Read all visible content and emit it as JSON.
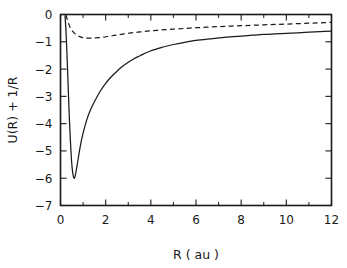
{
  "chart_data": {
    "type": "line",
    "title": "",
    "subtitle": "",
    "xlabel": "R ( au )",
    "ylabel": "U(R) + 1/R",
    "xlim": [
      0,
      12
    ],
    "ylim": [
      -7,
      0
    ],
    "grid": false,
    "legend": null,
    "legend_position": "none",
    "x_ticks": [
      0,
      2,
      4,
      6,
      8,
      10,
      12
    ],
    "x_tick_labels": [
      "0",
      "2",
      "4",
      "6",
      "8",
      "10",
      "12"
    ],
    "x_minor_ticks": [
      1,
      3,
      5,
      7,
      9,
      11
    ],
    "y_ticks": [
      0,
      -1,
      -2,
      -3,
      -4,
      -5,
      -6,
      -7
    ],
    "y_tick_labels": [
      "0",
      "−1",
      "−2",
      "−3",
      "−4",
      "−5",
      "−6",
      "−7"
    ],
    "series": [
      {
        "name": "solid-curve",
        "style": "solid",
        "color": "#1a1a1a",
        "x": [
          0.2,
          0.24,
          0.28,
          0.32,
          0.36,
          0.4,
          0.44,
          0.48,
          0.52,
          0.56,
          0.6,
          0.64,
          0.68,
          0.74,
          0.8,
          0.9,
          1.0,
          1.15,
          1.3,
          1.5,
          1.75,
          2.0,
          2.25,
          2.5,
          2.75,
          3.0,
          3.25,
          3.5,
          4.0,
          4.5,
          5.0,
          5.5,
          6.0,
          6.5,
          7.0,
          7.5,
          8.0,
          8.5,
          9.0,
          9.5,
          10.0,
          10.5,
          11.0,
          11.5,
          12.0
        ],
        "y": [
          -0.05,
          -0.55,
          -1.3,
          -2.2,
          -3.1,
          -3.95,
          -4.65,
          -5.25,
          -5.65,
          -5.9,
          -6.0,
          -5.95,
          -5.8,
          -5.5,
          -5.2,
          -4.72,
          -4.35,
          -3.9,
          -3.55,
          -3.2,
          -2.82,
          -2.52,
          -2.28,
          -2.08,
          -1.9,
          -1.75,
          -1.62,
          -1.52,
          -1.33,
          -1.2,
          -1.1,
          -1.02,
          -0.95,
          -0.9,
          -0.86,
          -0.82,
          -0.79,
          -0.76,
          -0.73,
          -0.71,
          -0.69,
          -0.67,
          -0.65,
          -0.63,
          -0.61
        ]
      },
      {
        "name": "dashed-curve",
        "style": "dashed",
        "color": "#1a1a1a",
        "x": [
          0.24,
          0.3,
          0.38,
          0.46,
          0.55,
          0.65,
          0.75,
          0.85,
          0.95,
          1.05,
          1.2,
          1.35,
          1.5,
          1.7,
          1.9,
          2.2,
          2.5,
          3.0,
          3.5,
          4.0,
          4.5,
          5.0,
          5.5,
          6.0,
          6.5,
          7.0,
          7.5,
          8.0,
          8.5,
          9.0,
          9.5,
          10.0,
          10.5,
          11.0,
          11.5,
          12.0
        ],
        "y": [
          -0.02,
          -0.18,
          -0.38,
          -0.52,
          -0.63,
          -0.71,
          -0.77,
          -0.81,
          -0.84,
          -0.855,
          -0.865,
          -0.865,
          -0.86,
          -0.85,
          -0.83,
          -0.79,
          -0.75,
          -0.69,
          -0.64,
          -0.6,
          -0.565,
          -0.535,
          -0.51,
          -0.485,
          -0.465,
          -0.445,
          -0.425,
          -0.41,
          -0.395,
          -0.38,
          -0.365,
          -0.35,
          -0.335,
          -0.32,
          -0.305,
          -0.29
        ]
      }
    ],
    "annotations": []
  }
}
